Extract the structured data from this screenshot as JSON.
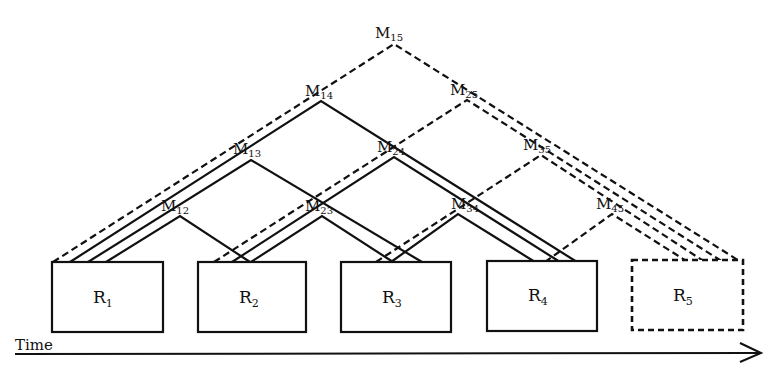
{
  "diagram": {
    "type": "message-path diagram over time",
    "axis": {
      "label": "Time",
      "direction": "left-to-right arrow"
    },
    "boxes": [
      {
        "id": "R1",
        "letter": "R",
        "sub": "1",
        "style": "solid"
      },
      {
        "id": "R2",
        "letter": "R",
        "sub": "2",
        "style": "solid"
      },
      {
        "id": "R3",
        "letter": "R",
        "sub": "3",
        "style": "solid"
      },
      {
        "id": "R4",
        "letter": "R",
        "sub": "4",
        "style": "solid"
      },
      {
        "id": "R5",
        "letter": "R",
        "sub": "5",
        "style": "dashed"
      }
    ],
    "messages": [
      {
        "id": "M12",
        "letter": "M",
        "sub": "12",
        "from": "R1",
        "to": "R2",
        "style": "solid"
      },
      {
        "id": "M13",
        "letter": "M",
        "sub": "13",
        "from": "R1",
        "to": "R3",
        "style": "solid"
      },
      {
        "id": "M14",
        "letter": "M",
        "sub": "14",
        "from": "R1",
        "to": "R4",
        "style": "solid"
      },
      {
        "id": "M15",
        "letter": "M",
        "sub": "15",
        "from": "R1",
        "to": "R5",
        "style": "dashed"
      },
      {
        "id": "M23",
        "letter": "M",
        "sub": "23",
        "from": "R2",
        "to": "R3",
        "style": "solid"
      },
      {
        "id": "M24",
        "letter": "M",
        "sub": "24",
        "from": "R2",
        "to": "R4",
        "style": "solid"
      },
      {
        "id": "M25",
        "letter": "M",
        "sub": "25",
        "from": "R2",
        "to": "R5",
        "style": "dashed"
      },
      {
        "id": "M34",
        "letter": "M",
        "sub": "34",
        "from": "R3",
        "to": "R4",
        "style": "solid"
      },
      {
        "id": "M35",
        "letter": "M",
        "sub": "35",
        "from": "R3",
        "to": "R5",
        "style": "dashed"
      },
      {
        "id": "M45",
        "letter": "M",
        "sub": "45",
        "from": "R4",
        "to": "R5",
        "style": "dashed"
      }
    ]
  }
}
